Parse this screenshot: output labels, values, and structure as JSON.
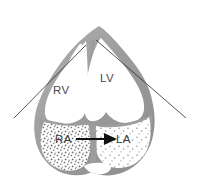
{
  "figure": {
    "background_color": "#ffffff",
    "width": 198,
    "height": 189
  },
  "colors": {
    "myocardial_wall": "#9d9d9d",
    "wall_highlight": "#b8b8b8",
    "wall_shadow": "#8a8a8a",
    "chamber_lumen": "#ffffff",
    "contrast_stipple": "#7e7e7e",
    "label_text": "#4a4a4a",
    "arrow": "#111111",
    "sector_line": "#2b2b2b"
  },
  "labels": {
    "right_ventricle": "RV",
    "left_ventricle": "LV",
    "right_atrium": "RA",
    "left_atrium": "LA"
  },
  "annotations": {
    "shunt_arrow": {
      "name": "right-to-left-shunt-arrow",
      "from": "RA",
      "to": "LA",
      "direction": "left-to-right"
    },
    "sector_lines": {
      "name": "ultrasound-sector-lines",
      "count": 2
    },
    "contrast_regions": [
      {
        "chamber": "RA",
        "density": "dense"
      },
      {
        "chamber": "LA",
        "density": "sparse"
      }
    ]
  }
}
